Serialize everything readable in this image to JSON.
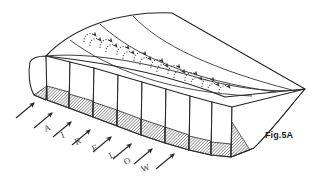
{
  "figure": {
    "id": "Fig.5A",
    "caption": "Fig.5A",
    "background_color": "#ffffff",
    "line_color": "#252525",
    "hatch_color": "#3d3d3d",
    "vortex_color": "#4a4a4a"
  },
  "airflow_label": {
    "text": "AIRFLOW",
    "letters": [
      {
        "char": "A",
        "x": 44,
        "y": 123,
        "rotate": -22
      },
      {
        "char": "I",
        "x": 61,
        "y": 130,
        "rotate": -22
      },
      {
        "char": "R",
        "x": 75,
        "y": 136,
        "rotate": -22
      },
      {
        "char": "F",
        "x": 92,
        "y": 143,
        "rotate": -22
      },
      {
        "char": "L",
        "x": 109,
        "y": 150,
        "rotate": -22
      },
      {
        "char": "O",
        "x": 124,
        "y": 156,
        "rotate": -22
      },
      {
        "char": "W",
        "x": 141,
        "y": 163,
        "rotate": -22
      }
    ]
  },
  "airflow_arrows": {
    "count": 8,
    "direction": "up-right",
    "angle_degrees": -38,
    "items": [
      {
        "x1": 16,
        "y1": 118,
        "x2": 34,
        "y2": 103
      },
      {
        "x1": 34,
        "y1": 128,
        "x2": 52,
        "y2": 113
      },
      {
        "x1": 53,
        "y1": 137,
        "x2": 71,
        "y2": 122
      },
      {
        "x1": 72,
        "y1": 145,
        "x2": 90,
        "y2": 130
      },
      {
        "x1": 93,
        "y1": 152,
        "x2": 111,
        "y2": 137
      },
      {
        "x1": 113,
        "y1": 159,
        "x2": 131,
        "y2": 144
      },
      {
        "x1": 134,
        "y1": 164,
        "x2": 152,
        "y2": 149
      },
      {
        "x1": 156,
        "y1": 169,
        "x2": 174,
        "y2": 154
      }
    ]
  },
  "cells": {
    "count": 8,
    "description": "Open rectangular duct cells along the leading edge, each with a hatched lower floor panel",
    "hatched": true
  },
  "vortex_markers": {
    "count": 9,
    "style": "dotted curved arrow",
    "description": "Dotted circulation arrows on the upper wing surface indicating vortex flow",
    "items": [
      {
        "x": 88,
        "y": 38,
        "scale": 1.0
      },
      {
        "x": 104,
        "y": 44,
        "scale": 1.0
      },
      {
        "x": 120,
        "y": 50,
        "scale": 1.0
      },
      {
        "x": 137,
        "y": 57,
        "scale": 1.0
      },
      {
        "x": 153,
        "y": 63,
        "scale": 1.0
      },
      {
        "x": 170,
        "y": 70,
        "scale": 1.0
      },
      {
        "x": 186,
        "y": 76,
        "scale": 1.0
      },
      {
        "x": 203,
        "y": 83,
        "scale": 1.0
      },
      {
        "x": 219,
        "y": 90,
        "scale": 1.0
      }
    ]
  },
  "surface": {
    "chordwise_lines": 6,
    "trailing_edge_point": {
      "x": 305,
      "y": 89
    },
    "description": "Curved upper wing surface divided by chordwise rib lines, tapering to a sharp trailing edge point at right"
  }
}
